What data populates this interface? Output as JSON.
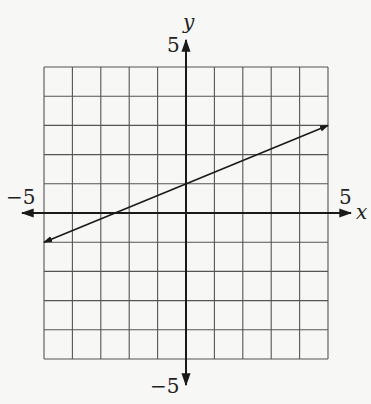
{
  "chart_data": {
    "type": "line",
    "title": "",
    "xlabel": "x",
    "ylabel": "y",
    "xlim": [
      -5,
      5
    ],
    "ylim": [
      -5,
      5
    ],
    "grid": true,
    "grid_step": 1,
    "tick_labels": {
      "x_min": "−5",
      "x_max": "5",
      "y_min": "−5",
      "y_max": "5"
    },
    "series": [
      {
        "name": "line",
        "equation": "y = 0.4x + 1",
        "x": [
          -5,
          0,
          5
        ],
        "y": [
          -1,
          1,
          3
        ],
        "arrows_both_ends": true
      }
    ],
    "colors": {
      "grid": "#555555",
      "axis": "#1a1a1a",
      "line": "#1a1a1a",
      "background": "#f7f7f5"
    }
  }
}
